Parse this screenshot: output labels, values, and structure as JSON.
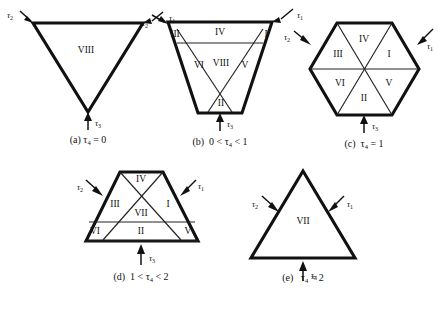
{
  "figure": {
    "background_color": "#ffffff",
    "line_color": "#111111",
    "panels": [
      {
        "id": "a",
        "shape": "downward-triangle",
        "caption_prefix": "(a)",
        "caption_expr": "τ",
        "caption_sub": "4",
        "caption_rest": "= 0",
        "caption_full": "(a) τ4 = 0",
        "regions": [
          {
            "label": "VIII"
          }
        ],
        "arrows": [
          {
            "name": "tau-2",
            "symbol": "τ",
            "sub": "2"
          },
          {
            "name": "tau-3",
            "symbol": "τ",
            "sub": "3"
          },
          {
            "name": "tau-1",
            "symbol": "τ",
            "sub": "1"
          }
        ]
      },
      {
        "id": "b",
        "shape": "truncated-downward-triangle",
        "caption_prefix": "(b)",
        "caption_expr": "0 < τ",
        "caption_sub": "4",
        "caption_rest": "< 1",
        "caption_full": "(b) 0 < τ4 < 1",
        "regions": [
          {
            "label": "III"
          },
          {
            "label": "IV"
          },
          {
            "label": "I"
          },
          {
            "label": "VI"
          },
          {
            "label": "VIII"
          },
          {
            "label": "V"
          },
          {
            "label": "II"
          }
        ],
        "arrows": [
          {
            "name": "tau-2",
            "symbol": "τ",
            "sub": "2"
          },
          {
            "name": "tau-3",
            "symbol": "τ",
            "sub": "3"
          },
          {
            "name": "tau-1",
            "symbol": "τ",
            "sub": "1"
          }
        ]
      },
      {
        "id": "c",
        "shape": "hexagon",
        "caption_prefix": "(c)",
        "caption_expr": "τ",
        "caption_sub": "4",
        "caption_rest": "= 1",
        "caption_full": "(c) τ4 = 1",
        "regions": [
          {
            "label": "IV"
          },
          {
            "label": "I"
          },
          {
            "label": "III"
          },
          {
            "label": "VI"
          },
          {
            "label": "V"
          },
          {
            "label": "II"
          }
        ],
        "arrows": [
          {
            "name": "tau-2",
            "symbol": "τ",
            "sub": "2"
          },
          {
            "name": "tau-3",
            "symbol": "τ",
            "sub": "3"
          },
          {
            "name": "tau-1",
            "symbol": "τ",
            "sub": "1"
          }
        ]
      },
      {
        "id": "d",
        "shape": "truncated-upward-triangle",
        "caption_prefix": "(d)",
        "caption_expr": "1 < τ",
        "caption_sub": "4",
        "caption_rest": "< 2",
        "caption_full": "(d) 1 < τ4 < 2",
        "regions": [
          {
            "label": "IV"
          },
          {
            "label": "III"
          },
          {
            "label": "VII"
          },
          {
            "label": "I"
          },
          {
            "label": "VI"
          },
          {
            "label": "II"
          },
          {
            "label": "V"
          }
        ],
        "arrows": [
          {
            "name": "tau-2",
            "symbol": "τ",
            "sub": "2"
          },
          {
            "name": "tau-3",
            "symbol": "τ",
            "sub": "3"
          },
          {
            "name": "tau-1",
            "symbol": "τ",
            "sub": "1"
          }
        ]
      },
      {
        "id": "e",
        "shape": "upward-triangle",
        "caption_prefix": "(e)",
        "caption_expr": "τ",
        "caption_sub": "4",
        "caption_rest": "= 2",
        "caption_full": "(e) τ4 = 2",
        "regions": [
          {
            "label": "VII"
          }
        ],
        "arrows": [
          {
            "name": "tau-2",
            "symbol": "τ",
            "sub": "2"
          },
          {
            "name": "tau-3",
            "symbol": "τ",
            "sub": "3"
          },
          {
            "name": "tau-1",
            "symbol": "τ",
            "sub": "1"
          }
        ]
      }
    ]
  }
}
